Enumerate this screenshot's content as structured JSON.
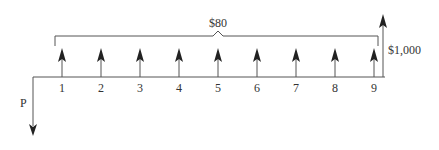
{
  "diagram": {
    "type": "cash-flow-diagram",
    "present_value_label": "P",
    "annuity_label": "$80",
    "future_value_label": "$1,000",
    "periods": [
      "1",
      "2",
      "3",
      "4",
      "5",
      "6",
      "7",
      "8",
      "9"
    ],
    "line_color": "#555555",
    "arrow_color": "#222222"
  }
}
